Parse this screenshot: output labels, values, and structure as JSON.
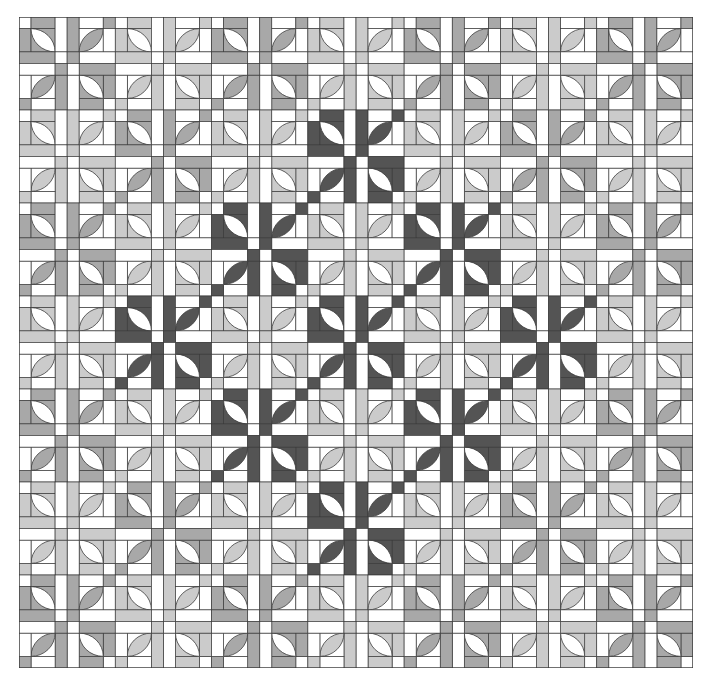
{
  "title": "Quilt pattern: Drunkard's Path style blocks with on-point dark diamond",
  "quilt": {
    "rows": 7,
    "cols": 7,
    "block_unit": 96,
    "palette": {
      "background": "#ffffff",
      "line": "#3a3a3a",
      "medium": "#a8a8a8",
      "light": "#cbcbcb",
      "dark": "#545454"
    },
    "shades": [
      [
        "medium",
        "light",
        "medium",
        "light",
        "medium",
        "light",
        "medium"
      ],
      [
        "light",
        "medium",
        "light",
        "dark",
        "light",
        "medium",
        "light"
      ],
      [
        "medium",
        "light",
        "dark",
        "light",
        "dark",
        "light",
        "medium"
      ],
      [
        "light",
        "dark",
        "light",
        "dark",
        "light",
        "dark",
        "light"
      ],
      [
        "medium",
        "light",
        "dark",
        "light",
        "dark",
        "light",
        "medium"
      ],
      [
        "light",
        "medium",
        "light",
        "dark",
        "light",
        "medium",
        "light"
      ],
      [
        "medium",
        "light",
        "medium",
        "light",
        "medium",
        "light",
        "medium"
      ]
    ]
  }
}
